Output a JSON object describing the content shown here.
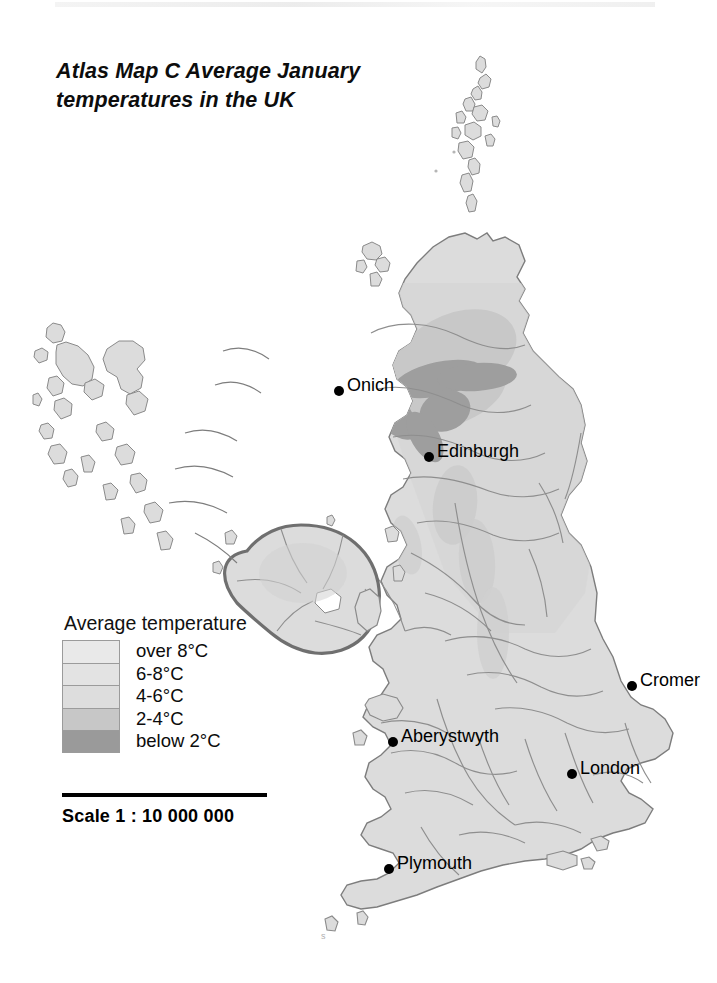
{
  "page": {
    "title_line1": "Atlas Map C  Average January",
    "title_line2": "temperatures in the UK"
  },
  "legend": {
    "heading": "Average temperature",
    "items": [
      {
        "label": "over 8°C",
        "color": "#e9e9e9"
      },
      {
        "label": "6-8°C",
        "color": "#e3e3e3"
      },
      {
        "label": "4-6°C",
        "color": "#dddddd"
      },
      {
        "label": "2-4°C",
        "color": "#c7c7c7"
      },
      {
        "label": "below 2°C",
        "color": "#9a9a9a"
      }
    ]
  },
  "scale": {
    "text": "Scale 1 : 10 000 000"
  },
  "cities": [
    {
      "name": "Onich",
      "label": "Onich",
      "x": 334,
      "y": 386,
      "side": "right"
    },
    {
      "name": "Edinburgh",
      "label": "Edinburgh",
      "x": 424,
      "y": 452,
      "side": "right"
    },
    {
      "name": "Cromer",
      "label": "Cromer",
      "x": 627,
      "y": 681,
      "side": "right"
    },
    {
      "name": "Aberystwyth",
      "label": "Aberystwyth",
      "x": 388,
      "y": 737,
      "side": "right"
    },
    {
      "name": "London",
      "label": "London",
      "x": 567,
      "y": 769,
      "side": "right"
    },
    {
      "name": "Plymouth",
      "label": "Plymouth",
      "x": 384,
      "y": 864,
      "side": "right"
    }
  ],
  "map": {
    "regions": [
      "Shetland Islands",
      "Orkney Islands",
      "Outer Hebrides",
      "Isle of Skye",
      "Scottish Highlands",
      "Grampian Mountains",
      "Central Scotland",
      "Southern Uplands",
      "Northern Ireland",
      "Isle of Man",
      "Pennines",
      "Northern England",
      "Wales",
      "Midlands",
      "East Anglia",
      "South East England",
      "South West England"
    ],
    "land_base_color": "#dcdcdc",
    "coast_line_color": "#7d7d7d",
    "county_line_color": "#8a8a8a",
    "cold_band_color": "#c3c3c3",
    "coldest_band_color": "#9a9a9a",
    "sea_color": "#ffffff"
  }
}
